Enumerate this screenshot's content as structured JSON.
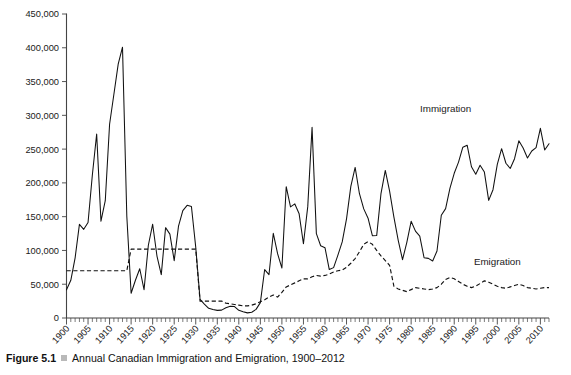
{
  "caption": {
    "figure_number": "Figure 5.1",
    "bullet_icon": "square-bullet-icon",
    "title": "Annual Canadian Immigration and Emigration, 1900–2012"
  },
  "chart_data": {
    "type": "line",
    "title": "Annual Canadian Immigration and Emigration, 1900–2012",
    "xlabel": "",
    "ylabel": "",
    "xlim": [
      1900,
      2012
    ],
    "ylim": [
      0,
      450000
    ],
    "grid": false,
    "legend_position": "inline-labels",
    "ytick_labels": [
      "0",
      "50,000",
      "100,000",
      "150,000",
      "200,000",
      "250,000",
      "300,000",
      "350,000",
      "400,000",
      "450,000"
    ],
    "ytick_values": [
      0,
      50000,
      100000,
      150000,
      200000,
      250000,
      300000,
      350000,
      400000,
      450000
    ],
    "xtick_labels": [
      "1900",
      "1905",
      "1910",
      "1915",
      "1920",
      "1925",
      "1930",
      "1935",
      "1940",
      "1945",
      "1950",
      "1955",
      "1960",
      "1965",
      "1970",
      "1975",
      "1980",
      "1985",
      "1990",
      "1995",
      "2000",
      "2005",
      "2010"
    ],
    "xtick_values": [
      1900,
      1905,
      1910,
      1915,
      1920,
      1925,
      1930,
      1935,
      1940,
      1945,
      1950,
      1955,
      1960,
      1965,
      1970,
      1975,
      1980,
      1985,
      1990,
      1995,
      2000,
      2005,
      2010
    ],
    "x": [
      1900,
      1901,
      1902,
      1903,
      1904,
      1905,
      1906,
      1907,
      1908,
      1909,
      1910,
      1911,
      1912,
      1913,
      1914,
      1915,
      1916,
      1917,
      1918,
      1919,
      1920,
      1921,
      1922,
      1923,
      1924,
      1925,
      1926,
      1927,
      1928,
      1929,
      1930,
      1931,
      1932,
      1933,
      1934,
      1935,
      1936,
      1937,
      1938,
      1939,
      1940,
      1941,
      1942,
      1943,
      1944,
      1945,
      1946,
      1947,
      1948,
      1949,
      1950,
      1951,
      1952,
      1953,
      1954,
      1955,
      1956,
      1957,
      1958,
      1959,
      1960,
      1961,
      1962,
      1963,
      1964,
      1965,
      1966,
      1967,
      1968,
      1969,
      1970,
      1971,
      1972,
      1973,
      1974,
      1975,
      1976,
      1977,
      1978,
      1979,
      1980,
      1981,
      1982,
      1983,
      1984,
      1985,
      1986,
      1987,
      1988,
      1989,
      1990,
      1991,
      1992,
      1993,
      1994,
      1995,
      1996,
      1997,
      1998,
      1999,
      2000,
      2001,
      2002,
      2003,
      2004,
      2005,
      2006,
      2007,
      2008,
      2009,
      2010,
      2011,
      2012
    ],
    "series": [
      {
        "name": "Immigration",
        "style": "solid",
        "color": "#111111",
        "label_position": {
          "x": 1988,
          "y": 305000
        },
        "values": [
          41681,
          55747,
          89102,
          138660,
          131252,
          141465,
          211653,
          272409,
          143326,
          173694,
          286839,
          331288,
          375756,
          400870,
          150484,
          36665,
          55914,
          72910,
          41845,
          107698,
          138824,
          91728,
          64224,
          133729,
          124164,
          84907,
          135982,
          158886,
          166783,
          164993,
          104806,
          27530,
          20591,
          14382,
          12476,
          11277,
          11643,
          15101,
          17244,
          16994,
          11324,
          9329,
          7576,
          8504,
          12801,
          22722,
          71719,
          64127,
          125414,
          95217,
          73912,
          194391,
          164498,
          168868,
          154227,
          109946,
          164857,
          282164,
          124851,
          106928,
          104111,
          71689,
          74586,
          93151,
          112606,
          146758,
          194743,
          222876,
          183974,
          161531,
          147713,
          121900,
          122006,
          184200,
          218465,
          187881,
          149429,
          114914,
          86313,
          112096,
          143117,
          128618,
          121147,
          89157,
          88239,
          84302,
          99219,
          152098,
          161929,
          192001,
          214230,
          230781,
          252842,
          255819,
          223875,
          212859,
          226071,
          216038,
          174159,
          189951,
          227455,
          250638,
          229048,
          221349,
          235824,
          262236,
          251649,
          236758,
          247243,
          252172,
          280681,
          248748,
          257887
        ]
      },
      {
        "name": "Emigration",
        "style": "dashed",
        "color": "#111111",
        "label_position": {
          "x": 2000,
          "y": 78000
        },
        "values": [
          70000,
          70000,
          70000,
          70000,
          70000,
          70000,
          70000,
          70000,
          70000,
          70000,
          70000,
          70000,
          70000,
          70000,
          70000,
          102000,
          102000,
          102000,
          102000,
          102000,
          102000,
          102000,
          102000,
          102000,
          102000,
          102000,
          102000,
          102000,
          102000,
          102000,
          102000,
          25000,
          25000,
          25000,
          25000,
          25000,
          25000,
          22000,
          21000,
          20000,
          19000,
          18000,
          18000,
          19000,
          21000,
          24000,
          27000,
          31000,
          34000,
          31000,
          38000,
          46000,
          49000,
          52000,
          55000,
          58000,
          58000,
          61000,
          63000,
          62000,
          63000,
          65000,
          68000,
          70000,
          71000,
          75000,
          81000,
          88000,
          98000,
          109000,
          113000,
          109000,
          100000,
          92000,
          85000,
          78000,
          47000,
          43000,
          41000,
          39000,
          42000,
          45000,
          44000,
          43000,
          42000,
          43000,
          45000,
          50000,
          57000,
          60000,
          58000,
          54000,
          50000,
          47000,
          45000,
          47000,
          51000,
          55000,
          53000,
          50000,
          47000,
          45000,
          44000,
          46000,
          48000,
          50000,
          48000,
          45000,
          44000,
          43000,
          44000,
          45000,
          45000
        ]
      }
    ],
    "annotations": [
      {
        "text": "Immigration",
        "name": "immigration-series-label"
      },
      {
        "text": "Emigration",
        "name": "emigration-series-label"
      }
    ]
  }
}
